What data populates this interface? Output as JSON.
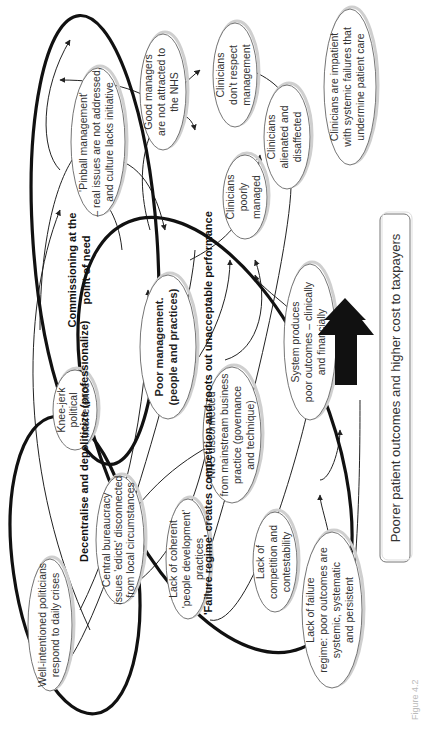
{
  "diagram": {
    "orientation": "rotated-90-ccw",
    "nodes": [
      {
        "id": "politicians",
        "lines": [
          "Well-intentioned politicians",
          "respond to daily crises"
        ]
      },
      {
        "id": "central-bureaucracy",
        "lines": [
          "Central bureaucracy",
          "issues 'edicts' disconnected",
          "from local circumstances"
        ]
      },
      {
        "id": "knee-jerk",
        "lines": [
          "Knee-jerk",
          "political",
          "interference"
        ]
      },
      {
        "id": "pinball",
        "lines": [
          "'Pinball management'",
          "– real issues are not addressed,",
          "and culture lacks initiative"
        ]
      },
      {
        "id": "good-managers",
        "lines": [
          "Good managers",
          "are not attracted to",
          "the NHS"
        ]
      },
      {
        "id": "poor-management",
        "lines": [
          "Poor management.",
          "(people and practices)"
        ],
        "bold": true
      },
      {
        "id": "people-development",
        "lines": [
          "Lack of coherent",
          "'people development'",
          "practices"
        ]
      },
      {
        "id": "nhs-disconnected",
        "lines": [
          "NHS disconnected",
          "from mainstream business",
          "practice (governance",
          "and technique)"
        ]
      },
      {
        "id": "competition",
        "lines": [
          "Lack of",
          "competition and",
          "contestability"
        ]
      },
      {
        "id": "failure-regime",
        "lines": [
          "Lack of failure",
          "regime: poor outcomes are",
          "systemic, systematic",
          "and persistent"
        ]
      },
      {
        "id": "clinicians-respect",
        "lines": [
          "Clinicians",
          "don't respect",
          "management"
        ]
      },
      {
        "id": "clinicians-poorly",
        "lines": [
          "Clinicians",
          "poorly",
          "managed"
        ]
      },
      {
        "id": "clinicians-alienated",
        "lines": [
          "Clinicians",
          "alienated and",
          "disaffected"
        ]
      },
      {
        "id": "clinicians-impatient",
        "lines": [
          "Clinicians are impatient",
          "with systemic failures that",
          "undermine patient care"
        ]
      },
      {
        "id": "system-produces",
        "lines": [
          "System produces",
          "poor outcomes – clinically",
          "and financially"
        ]
      }
    ],
    "ring_labels": {
      "decentralise": "Decentralise and depoliticize (professionalize)",
      "commissioning": [
        "Commissioning at the",
        "point of need"
      ],
      "failure_regime": "'Failure regime' creates competition and roots out unacceptable performance"
    },
    "outcome": "Poorer patient outcomes and higher cost to taxpayers",
    "caption": "Figure 4.2"
  }
}
